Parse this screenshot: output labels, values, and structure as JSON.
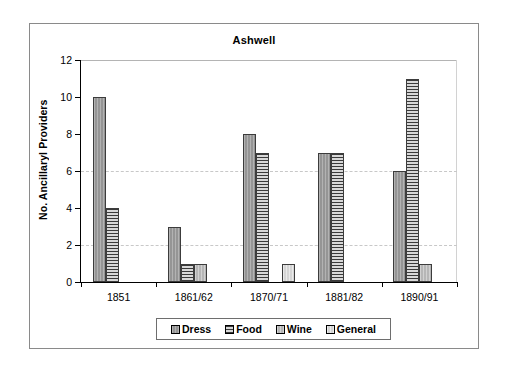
{
  "chart_data": {
    "type": "bar",
    "title": "Ashwell",
    "xlabel": "",
    "ylabel": "No. Ancillaryl Providers",
    "categories": [
      "1851",
      "1861/62",
      "1870/71",
      "1881/82",
      "1890/91"
    ],
    "series": [
      {
        "name": "Dress",
        "values": [
          10,
          3,
          8,
          7,
          6
        ]
      },
      {
        "name": "Food",
        "values": [
          4,
          1,
          7,
          7,
          11
        ]
      },
      {
        "name": "Wine",
        "values": [
          0,
          1,
          0,
          0,
          1
        ]
      },
      {
        "name": "General",
        "values": [
          0,
          0,
          1,
          0,
          0
        ]
      }
    ],
    "ylim": [
      0,
      12
    ],
    "yticks": [
      0,
      2,
      4,
      6,
      8,
      10,
      12
    ],
    "ytick_labels": [
      "0",
      "2",
      "4",
      "6",
      "8",
      "10",
      "12"
    ],
    "gridlines": [
      2,
      6
    ],
    "grid": true,
    "legend_position": "bottom",
    "legend_entries": [
      "Dress",
      "Food",
      "Wine",
      "General"
    ]
  },
  "colors": {
    "dress": "#9d9d9d",
    "food": "#6e6e6e",
    "wine": "#bdbdbd",
    "general": "#dcdcdc",
    "axis": "#000000",
    "grid": "#c8c8c8",
    "frame": "#8a8a8a",
    "background": "#ffffff"
  }
}
